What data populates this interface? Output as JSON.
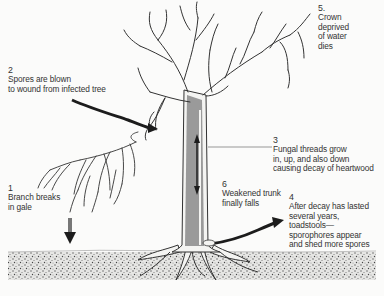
{
  "diagram": {
    "steps": [
      {
        "number": "1",
        "lines": [
          "Branch breaks",
          "in gale"
        ]
      },
      {
        "number": "2",
        "lines": [
          "Spores are blown",
          "to wound from infected tree"
        ]
      },
      {
        "number": "3",
        "lines": [
          "Fungal threads grow",
          "in, up, and also down",
          "causing decay of heartwood"
        ]
      },
      {
        "number": "4",
        "lines": [
          "After decay has lasted",
          "several years,",
          "toadstools—",
          "sporophores appear",
          "and shed more spores"
        ]
      },
      {
        "number": "5.",
        "lines": [
          "Crown",
          "deprived",
          "of  water",
          "dies"
        ]
      },
      {
        "number": "6",
        "lines": [
          "Weakened trunk",
          "finally falls"
        ]
      }
    ],
    "colors": {
      "ink": "#2a2a2a",
      "heartwood": "#9a9a9a",
      "arrow": "#1c1c1c",
      "soil": "#7a7a7a",
      "background": "#fbfbfa"
    }
  }
}
